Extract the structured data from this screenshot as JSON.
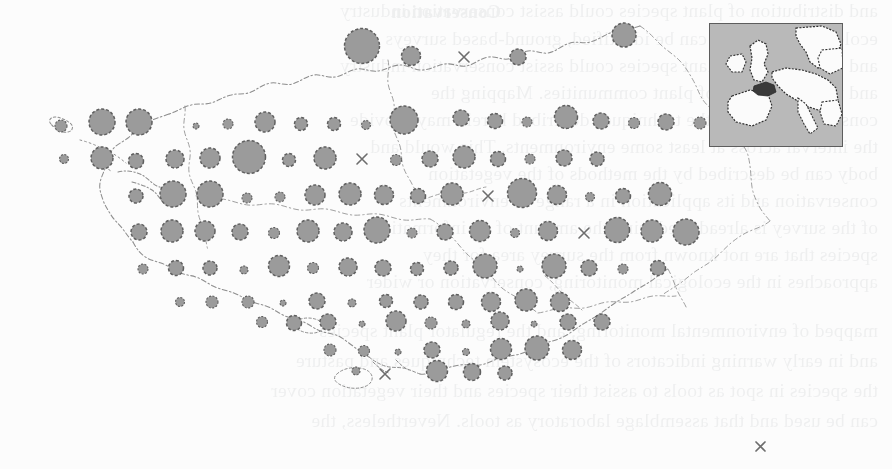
{
  "page": {
    "width": 892,
    "height": 469,
    "background_color": "#fcfcfc",
    "kind": "scanned-book-page-figure"
  },
  "figure": {
    "name": "distribution-map",
    "region": "Brittany (Bretagne), north-west France",
    "projection_note": "regular sampling grid of proportional circles over departmental outlines",
    "symbol_legend": [
      {
        "symbol": "circle",
        "meaning": "record present - area proportional to value"
      },
      {
        "symbol": "cross",
        "meaning": "no record / zero value"
      }
    ],
    "colors": {
      "circle_fill": "#9b9b9b",
      "circle_stroke": "#5f5f5f",
      "coastline": "#8e8e8e",
      "boundary": "#9a9a9a",
      "cross": "#6d6d6d",
      "inset_sea": "#b9b9b9",
      "inset_land": "#fbfbfb",
      "inset_highlight": "#3a3a3a",
      "inset_border": "#5d5d5d",
      "paper": "#fcfcfc",
      "ghost_text": "#13202c"
    }
  },
  "inset": {
    "name": "europe-locator-inset",
    "x": 709,
    "y": 23,
    "width": 134,
    "height": 124,
    "highlight_label": "Brittany"
  },
  "lone_symbol": {
    "name": "isolated-cross-marker",
    "symbol": "×",
    "x": 760,
    "y": 443,
    "size": 11
  },
  "grid": {
    "origin_x": 75,
    "origin_y": 46,
    "step_x": 35.1,
    "step_y": 37.4,
    "columns": 22,
    "rows": 10
  },
  "chart_data": {
    "type": "scatter",
    "title": "",
    "xlabel": "",
    "ylabel": "",
    "encoding": "circle radius proportional to square-root of value; cross = absent",
    "radius_scale": {
      "min": 2.0,
      "max": 18.0,
      "unit": "px"
    },
    "points": [
      {
        "col": 8,
        "row": 0,
        "cx": 362,
        "cy": 46,
        "r": 17.5,
        "symbol": "circle"
      },
      {
        "col": 10,
        "row": 0,
        "cx": 411,
        "cy": 56,
        "r": 9.5,
        "symbol": "circle"
      },
      {
        "col": 12,
        "row": 0,
        "cx": 464,
        "cy": 57,
        "r": 5.0,
        "symbol": "cross"
      },
      {
        "col": 14,
        "row": 0,
        "cx": 518,
        "cy": 57,
        "r": 8.0,
        "symbol": "circle"
      },
      {
        "col": 17,
        "row": 0,
        "cx": 624,
        "cy": 35,
        "r": 12.0,
        "symbol": "circle"
      },
      {
        "col": 2,
        "row": 1,
        "cx": 102,
        "cy": 122,
        "r": 13.0,
        "symbol": "circle"
      },
      {
        "col": 3,
        "row": 1,
        "cx": 139,
        "cy": 122,
        "r": 13.0,
        "symbol": "circle"
      },
      {
        "col": 5,
        "row": 1,
        "cx": 196,
        "cy": 126,
        "r": 3.0,
        "symbol": "circle"
      },
      {
        "col": 6,
        "row": 1,
        "cx": 228,
        "cy": 124,
        "r": 5.0,
        "symbol": "circle"
      },
      {
        "col": 7,
        "row": 1,
        "cx": 265,
        "cy": 122,
        "r": 10.0,
        "symbol": "circle"
      },
      {
        "col": 9,
        "row": 1,
        "cx": 301,
        "cy": 124,
        "r": 6.5,
        "symbol": "circle"
      },
      {
        "col": 10,
        "row": 1,
        "cx": 334,
        "cy": 124,
        "r": 6.5,
        "symbol": "circle"
      },
      {
        "col": 11,
        "row": 1,
        "cx": 366,
        "cy": 125,
        "r": 4.5,
        "symbol": "circle"
      },
      {
        "col": 12,
        "row": 1,
        "cx": 404,
        "cy": 120,
        "r": 14.0,
        "symbol": "circle"
      },
      {
        "col": 14,
        "row": 1,
        "cx": 461,
        "cy": 118,
        "r": 8.0,
        "symbol": "circle"
      },
      {
        "col": 15,
        "row": 1,
        "cx": 495,
        "cy": 121,
        "r": 7.5,
        "symbol": "circle"
      },
      {
        "col": 16,
        "row": 1,
        "cx": 527,
        "cy": 122,
        "r": 5.0,
        "symbol": "circle"
      },
      {
        "col": 17,
        "row": 1,
        "cx": 566,
        "cy": 117,
        "r": 11.5,
        "symbol": "circle"
      },
      {
        "col": 18,
        "row": 1,
        "cx": 601,
        "cy": 121,
        "r": 8.0,
        "symbol": "circle"
      },
      {
        "col": 19,
        "row": 1,
        "cx": 634,
        "cy": 123,
        "r": 5.5,
        "symbol": "circle"
      },
      {
        "col": 20,
        "row": 1,
        "cx": 666,
        "cy": 122,
        "r": 8.0,
        "symbol": "circle"
      },
      {
        "col": 21,
        "row": 1,
        "cx": 700,
        "cy": 123,
        "r": 6.0,
        "symbol": "circle"
      },
      {
        "col": 0,
        "row": 1,
        "cx": 61,
        "cy": 126,
        "r": 6.0,
        "symbol": "circle"
      },
      {
        "col": 2,
        "row": 2,
        "cx": 102,
        "cy": 158,
        "r": 11.0,
        "symbol": "circle"
      },
      {
        "col": 3,
        "row": 2,
        "cx": 136,
        "cy": 161,
        "r": 7.5,
        "symbol": "circle"
      },
      {
        "col": 5,
        "row": 2,
        "cx": 175,
        "cy": 159,
        "r": 9.0,
        "symbol": "circle"
      },
      {
        "col": 6,
        "row": 2,
        "cx": 210,
        "cy": 158,
        "r": 10.0,
        "symbol": "circle"
      },
      {
        "col": 7,
        "row": 2,
        "cx": 249,
        "cy": 157,
        "r": 16.5,
        "symbol": "circle"
      },
      {
        "col": 9,
        "row": 2,
        "cx": 289,
        "cy": 160,
        "r": 6.5,
        "symbol": "circle"
      },
      {
        "col": 10,
        "row": 2,
        "cx": 325,
        "cy": 158,
        "r": 11.0,
        "symbol": "circle"
      },
      {
        "col": 11,
        "row": 2,
        "cx": 362,
        "cy": 159,
        "r": 5.0,
        "symbol": "cross"
      },
      {
        "col": 12,
        "row": 2,
        "cx": 396,
        "cy": 160,
        "r": 5.5,
        "symbol": "circle"
      },
      {
        "col": 13,
        "row": 2,
        "cx": 430,
        "cy": 159,
        "r": 8.0,
        "symbol": "circle"
      },
      {
        "col": 14,
        "row": 2,
        "cx": 464,
        "cy": 157,
        "r": 11.0,
        "symbol": "circle"
      },
      {
        "col": 15,
        "row": 2,
        "cx": 498,
        "cy": 159,
        "r": 7.5,
        "symbol": "circle"
      },
      {
        "col": 16,
        "row": 2,
        "cx": 530,
        "cy": 159,
        "r": 5.0,
        "symbol": "circle"
      },
      {
        "col": 17,
        "row": 2,
        "cx": 564,
        "cy": 158,
        "r": 8.0,
        "symbol": "circle"
      },
      {
        "col": 18,
        "row": 2,
        "cx": 597,
        "cy": 159,
        "r": 7.0,
        "symbol": "circle"
      },
      {
        "col": 0,
        "row": 2,
        "cx": 64,
        "cy": 159,
        "r": 4.5,
        "symbol": "circle"
      },
      {
        "col": 3,
        "row": 3,
        "cx": 136,
        "cy": 196,
        "r": 7.0,
        "symbol": "circle"
      },
      {
        "col": 5,
        "row": 3,
        "cx": 173,
        "cy": 194,
        "r": 13.0,
        "symbol": "circle"
      },
      {
        "col": 6,
        "row": 3,
        "cx": 210,
        "cy": 194,
        "r": 13.0,
        "symbol": "circle"
      },
      {
        "col": 7,
        "row": 3,
        "cx": 247,
        "cy": 198,
        "r": 5.0,
        "symbol": "circle"
      },
      {
        "col": 8,
        "row": 3,
        "cx": 280,
        "cy": 197,
        "r": 5.0,
        "symbol": "circle"
      },
      {
        "col": 9,
        "row": 3,
        "cx": 315,
        "cy": 195,
        "r": 10.0,
        "symbol": "circle"
      },
      {
        "col": 10,
        "row": 3,
        "cx": 350,
        "cy": 194,
        "r": 11.0,
        "symbol": "circle"
      },
      {
        "col": 11,
        "row": 3,
        "cx": 384,
        "cy": 195,
        "r": 9.5,
        "symbol": "circle"
      },
      {
        "col": 12,
        "row": 3,
        "cx": 418,
        "cy": 196,
        "r": 7.5,
        "symbol": "circle"
      },
      {
        "col": 13,
        "row": 3,
        "cx": 452,
        "cy": 194,
        "r": 11.0,
        "symbol": "circle"
      },
      {
        "col": 14,
        "row": 3,
        "cx": 488,
        "cy": 196,
        "r": 5.0,
        "symbol": "cross"
      },
      {
        "col": 15,
        "row": 3,
        "cx": 522,
        "cy": 193,
        "r": 14.5,
        "symbol": "circle"
      },
      {
        "col": 16,
        "row": 3,
        "cx": 557,
        "cy": 195,
        "r": 9.5,
        "symbol": "circle"
      },
      {
        "col": 17,
        "row": 3,
        "cx": 590,
        "cy": 197,
        "r": 4.5,
        "symbol": "circle"
      },
      {
        "col": 18,
        "row": 3,
        "cx": 623,
        "cy": 196,
        "r": 7.5,
        "symbol": "circle"
      },
      {
        "col": 19,
        "row": 3,
        "cx": 660,
        "cy": 194,
        "r": 11.5,
        "symbol": "circle"
      },
      {
        "col": 3,
        "row": 4,
        "cx": 139,
        "cy": 232,
        "r": 8.0,
        "symbol": "circle"
      },
      {
        "col": 4,
        "row": 4,
        "cx": 172,
        "cy": 231,
        "r": 11.0,
        "symbol": "circle"
      },
      {
        "col": 5,
        "row": 4,
        "cx": 205,
        "cy": 231,
        "r": 10.0,
        "symbol": "circle"
      },
      {
        "col": 6,
        "row": 4,
        "cx": 240,
        "cy": 232,
        "r": 8.0,
        "symbol": "circle"
      },
      {
        "col": 7,
        "row": 4,
        "cx": 274,
        "cy": 233,
        "r": 5.5,
        "symbol": "circle"
      },
      {
        "col": 8,
        "row": 4,
        "cx": 308,
        "cy": 231,
        "r": 11.0,
        "symbol": "circle"
      },
      {
        "col": 9,
        "row": 4,
        "cx": 343,
        "cy": 232,
        "r": 9.0,
        "symbol": "circle"
      },
      {
        "col": 10,
        "row": 4,
        "cx": 377,
        "cy": 230,
        "r": 13.0,
        "symbol": "circle"
      },
      {
        "col": 11,
        "row": 4,
        "cx": 412,
        "cy": 233,
        "r": 5.0,
        "symbol": "circle"
      },
      {
        "col": 12,
        "row": 4,
        "cx": 445,
        "cy": 232,
        "r": 8.0,
        "symbol": "circle"
      },
      {
        "col": 13,
        "row": 4,
        "cx": 480,
        "cy": 231,
        "r": 10.5,
        "symbol": "circle"
      },
      {
        "col": 14,
        "row": 4,
        "cx": 515,
        "cy": 233,
        "r": 4.5,
        "symbol": "circle"
      },
      {
        "col": 15,
        "row": 4,
        "cx": 548,
        "cy": 231,
        "r": 9.5,
        "symbol": "circle"
      },
      {
        "col": 16,
        "row": 4,
        "cx": 584,
        "cy": 233,
        "r": 5.0,
        "symbol": "cross"
      },
      {
        "col": 17,
        "row": 4,
        "cx": 617,
        "cy": 230,
        "r": 12.5,
        "symbol": "circle"
      },
      {
        "col": 18,
        "row": 4,
        "cx": 652,
        "cy": 231,
        "r": 11.0,
        "symbol": "circle"
      },
      {
        "col": 19,
        "row": 4,
        "cx": 686,
        "cy": 232,
        "r": 13.0,
        "symbol": "circle"
      },
      {
        "col": 3,
        "row": 5,
        "cx": 143,
        "cy": 269,
        "r": 5.0,
        "symbol": "circle"
      },
      {
        "col": 4,
        "row": 5,
        "cx": 176,
        "cy": 268,
        "r": 7.5,
        "symbol": "circle"
      },
      {
        "col": 5,
        "row": 5,
        "cx": 210,
        "cy": 268,
        "r": 7.0,
        "symbol": "circle"
      },
      {
        "col": 6,
        "row": 5,
        "cx": 244,
        "cy": 270,
        "r": 4.0,
        "symbol": "circle"
      },
      {
        "col": 7,
        "row": 5,
        "cx": 279,
        "cy": 266,
        "r": 10.5,
        "symbol": "circle"
      },
      {
        "col": 8,
        "row": 5,
        "cx": 313,
        "cy": 268,
        "r": 5.5,
        "symbol": "circle"
      },
      {
        "col": 9,
        "row": 5,
        "cx": 348,
        "cy": 267,
        "r": 9.0,
        "symbol": "circle"
      },
      {
        "col": 10,
        "row": 5,
        "cx": 383,
        "cy": 268,
        "r": 8.0,
        "symbol": "circle"
      },
      {
        "col": 11,
        "row": 5,
        "cx": 417,
        "cy": 269,
        "r": 6.5,
        "symbol": "circle"
      },
      {
        "col": 12,
        "row": 5,
        "cx": 451,
        "cy": 268,
        "r": 7.0,
        "symbol": "circle"
      },
      {
        "col": 13,
        "row": 5,
        "cx": 485,
        "cy": 266,
        "r": 12.0,
        "symbol": "circle"
      },
      {
        "col": 14,
        "row": 5,
        "cx": 520,
        "cy": 269,
        "r": 3.0,
        "symbol": "circle"
      },
      {
        "col": 15,
        "row": 5,
        "cx": 554,
        "cy": 266,
        "r": 12.0,
        "symbol": "circle"
      },
      {
        "col": 16,
        "row": 5,
        "cx": 589,
        "cy": 268,
        "r": 8.0,
        "symbol": "circle"
      },
      {
        "col": 17,
        "row": 5,
        "cx": 623,
        "cy": 269,
        "r": 5.0,
        "symbol": "circle"
      },
      {
        "col": 18,
        "row": 5,
        "cx": 658,
        "cy": 268,
        "r": 7.5,
        "symbol": "circle"
      },
      {
        "col": 4,
        "row": 6,
        "cx": 180,
        "cy": 302,
        "r": 4.5,
        "symbol": "circle"
      },
      {
        "col": 5,
        "row": 6,
        "cx": 212,
        "cy": 302,
        "r": 6.0,
        "symbol": "circle"
      },
      {
        "col": 6,
        "row": 6,
        "cx": 248,
        "cy": 302,
        "r": 6.0,
        "symbol": "circle"
      },
      {
        "col": 7,
        "row": 6,
        "cx": 283,
        "cy": 303,
        "r": 3.0,
        "symbol": "circle"
      },
      {
        "col": 8,
        "row": 6,
        "cx": 317,
        "cy": 301,
        "r": 8.0,
        "symbol": "circle"
      },
      {
        "col": 9,
        "row": 6,
        "cx": 352,
        "cy": 303,
        "r": 4.0,
        "symbol": "circle"
      },
      {
        "col": 10,
        "row": 6,
        "cx": 386,
        "cy": 301,
        "r": 6.5,
        "symbol": "circle"
      },
      {
        "col": 11,
        "row": 6,
        "cx": 421,
        "cy": 302,
        "r": 7.0,
        "symbol": "circle"
      },
      {
        "col": 12,
        "row": 6,
        "cx": 456,
        "cy": 302,
        "r": 7.5,
        "symbol": "circle"
      },
      {
        "col": 13,
        "row": 6,
        "cx": 491,
        "cy": 302,
        "r": 9.5,
        "symbol": "circle"
      },
      {
        "col": 14,
        "row": 6,
        "cx": 526,
        "cy": 300,
        "r": 11.0,
        "symbol": "circle"
      },
      {
        "col": 15,
        "row": 6,
        "cx": 560,
        "cy": 302,
        "r": 9.5,
        "symbol": "circle"
      },
      {
        "col": 4,
        "row": 7,
        "cx": 262,
        "cy": 322,
        "r": 5.5,
        "symbol": "circle"
      },
      {
        "col": 5,
        "row": 7,
        "cx": 294,
        "cy": 323,
        "r": 7.5,
        "symbol": "circle"
      },
      {
        "col": 6,
        "row": 7,
        "cx": 328,
        "cy": 322,
        "r": 8.0,
        "symbol": "circle"
      },
      {
        "col": 7,
        "row": 7,
        "cx": 362,
        "cy": 324,
        "r": 3.0,
        "symbol": "circle"
      },
      {
        "col": 8,
        "row": 7,
        "cx": 396,
        "cy": 321,
        "r": 10.0,
        "symbol": "circle"
      },
      {
        "col": 9,
        "row": 7,
        "cx": 431,
        "cy": 323,
        "r": 6.0,
        "symbol": "circle"
      },
      {
        "col": 10,
        "row": 7,
        "cx": 466,
        "cy": 324,
        "r": 4.0,
        "symbol": "circle"
      },
      {
        "col": 11,
        "row": 7,
        "cx": 500,
        "cy": 321,
        "r": 9.0,
        "symbol": "circle"
      },
      {
        "col": 12,
        "row": 7,
        "cx": 534,
        "cy": 324,
        "r": 3.0,
        "symbol": "circle"
      },
      {
        "col": 13,
        "row": 7,
        "cx": 568,
        "cy": 322,
        "r": 8.0,
        "symbol": "circle"
      },
      {
        "col": 14,
        "row": 7,
        "cx": 602,
        "cy": 322,
        "r": 8.0,
        "symbol": "circle"
      },
      {
        "col": 6,
        "row": 8,
        "cx": 330,
        "cy": 350,
        "r": 6.0,
        "symbol": "circle"
      },
      {
        "col": 7,
        "row": 8,
        "cx": 364,
        "cy": 351,
        "r": 5.5,
        "symbol": "circle"
      },
      {
        "col": 8,
        "row": 8,
        "cx": 398,
        "cy": 352,
        "r": 3.0,
        "symbol": "circle"
      },
      {
        "col": 9,
        "row": 8,
        "cx": 432,
        "cy": 350,
        "r": 8.0,
        "symbol": "circle"
      },
      {
        "col": 10,
        "row": 8,
        "cx": 466,
        "cy": 352,
        "r": 3.5,
        "symbol": "circle"
      },
      {
        "col": 11,
        "row": 8,
        "cx": 501,
        "cy": 349,
        "r": 10.5,
        "symbol": "circle"
      },
      {
        "col": 12,
        "row": 8,
        "cx": 537,
        "cy": 348,
        "r": 12.0,
        "symbol": "circle"
      },
      {
        "col": 13,
        "row": 8,
        "cx": 572,
        "cy": 350,
        "r": 9.5,
        "symbol": "circle"
      },
      {
        "col": 7,
        "row": 9,
        "cx": 356,
        "cy": 371,
        "r": 4.0,
        "symbol": "circle"
      },
      {
        "col": 8,
        "row": 9,
        "cx": 385,
        "cy": 374,
        "r": 5.0,
        "symbol": "cross"
      },
      {
        "col": 10,
        "row": 9,
        "cx": 437,
        "cy": 371,
        "r": 10.5,
        "symbol": "circle"
      },
      {
        "col": 11,
        "row": 9,
        "cx": 472,
        "cy": 372,
        "r": 8.5,
        "symbol": "circle"
      },
      {
        "col": 12,
        "row": 9,
        "cx": 505,
        "cy": 373,
        "r": 7.0,
        "symbol": "circle"
      }
    ]
  },
  "ghost_text": {
    "note": "faint mirrored show-through of text printed on the reverse of the scanned page",
    "title": "Conservation",
    "lines": [
      "ecological processes can be identified, ground-based surveys",
      "and distribution of plant species could assist conservation industry",
      "and the distribution of plant communities. Mapping the",
      "conservation issues, the techniques described herein may provide",
      "the interval across at least some environments. This would and",
      "body can be described by the methods of the vegetation",
      "conservation and its application in a range of environments",
      "of the survey is already reducing the amount of an information",
      "species that are not known from the survey area for they",
      "approaches in the ecological monitoring, conservation or wider",
      "mapped of environmental monitoring, and the regulator plant species",
      "and in early warning indicators of the ecosystem techniques and pasture",
      "the species in spot as tools to assist their species and their vegetation cover",
      "can be used and that assemblage laboratory as tools. Nevertheless, the"
    ]
  }
}
